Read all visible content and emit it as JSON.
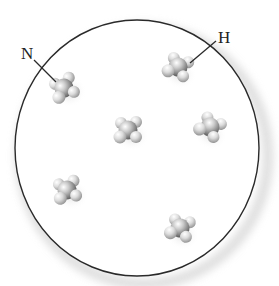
{
  "diagram": {
    "container": {
      "shape": "circle",
      "cx": 137,
      "cy": 148,
      "rx": 122,
      "ry": 128,
      "stroke": "#2a2a2a",
      "shadow": "#d8d8d8"
    },
    "labels": [
      {
        "id": "nitrogen",
        "text": "N",
        "x": 21,
        "y": 45,
        "line": {
          "x1": 34,
          "y1": 60,
          "x2": 56,
          "y2": 82
        }
      },
      {
        "id": "hydrogen",
        "text": "H",
        "x": 218,
        "y": 29,
        "line": {
          "x1": 216,
          "y1": 41,
          "x2": 190,
          "y2": 63
        }
      }
    ],
    "molecules": [
      {
        "id": "m1",
        "formula": "NH3",
        "cx": 64,
        "cy": 88,
        "rot": -20
      },
      {
        "id": "m2",
        "formula": "NH3",
        "cx": 178,
        "cy": 67,
        "rot": 20
      },
      {
        "id": "m3",
        "formula": "NH3",
        "cx": 128,
        "cy": 130,
        "rot": 0
      },
      {
        "id": "m4",
        "formula": "NH3",
        "cx": 210,
        "cy": 127,
        "rot": 30
      },
      {
        "id": "m5",
        "formula": "NH3",
        "cx": 67,
        "cy": 190,
        "rot": -10
      },
      {
        "id": "m6",
        "formula": "NH3",
        "cx": 180,
        "cy": 228,
        "rot": 15
      }
    ],
    "colors": {
      "nitrogen_atom": "#9a9a9a",
      "hydrogen_atom": "#cfcfcf",
      "highlight": "#ffffff",
      "line": "#2a2a2a"
    }
  }
}
